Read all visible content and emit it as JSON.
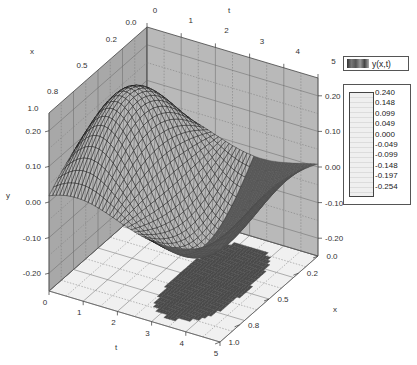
{
  "chart_data": {
    "type": "surface3d",
    "title": "",
    "series_name": "y(x,t)",
    "axes": {
      "x": {
        "label": "x",
        "ticks": [
          "0.0",
          "0.2",
          "0.5",
          "0.8",
          "1.0"
        ],
        "range": [
          0.0,
          1.0
        ]
      },
      "t": {
        "label": "t",
        "ticks": [
          "0",
          "1",
          "2",
          "3",
          "4",
          "5"
        ],
        "range": [
          0,
          5
        ]
      },
      "y": {
        "label": "y",
        "ticks": [
          "0.20",
          "0.10",
          "0.00",
          "-0.10",
          "-0.20"
        ],
        "range": [
          -0.25,
          0.25
        ]
      }
    },
    "colorbar": {
      "levels": [
        "0.240",
        "0.148",
        "0.099",
        "0.049",
        "0.000",
        "-0.049",
        "-0.099",
        "-0.148",
        "-0.197",
        "-0.254"
      ],
      "min": -0.254,
      "max": 0.24
    },
    "surface_description": "Wave y(x,t): peak ~0.22 near x=0.8,t=0.9; trough ~-0.25 near x=0.8,t=2.5; second crest ~0.07 at x=0.1,t=4.3; projected dark shadow on floor plane",
    "grid": true,
    "legend_position": "right"
  },
  "legend": {
    "label": "y(x,t)"
  },
  "colors": {
    "back_wall": "#b9b9b9",
    "side_wall": "#a8a8a8",
    "floor": "#f0f0f0",
    "shadow": "#4a4a4a",
    "mesh": "#111111"
  }
}
